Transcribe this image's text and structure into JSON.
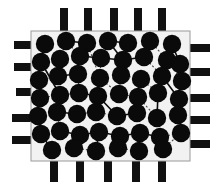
{
  "figure": {
    "title": "Chip floorplan with placed cells and interconnect nets",
    "width": 221,
    "height": 187,
    "background_color": "#ffffff"
  },
  "chart_data": {
    "type": "scatter",
    "title": "Chip floorplan with placed cells and interconnect nets",
    "xlabel": "",
    "ylabel": "",
    "xlim": [
      31,
      190
    ],
    "ylim": [
      31,
      161
    ],
    "grid": false,
    "legend_position": "none",
    "series": [
      {
        "name": "cells",
        "marker": "filled-circle",
        "color": "#0a0a0a",
        "radius": 9.2,
        "points": [
          [
            45,
            44
          ],
          [
            66,
            41
          ],
          [
            87,
            43
          ],
          [
            108,
            41
          ],
          [
            128,
            43
          ],
          [
            150,
            41
          ],
          [
            172,
            44
          ],
          [
            41,
            62
          ],
          [
            60,
            59
          ],
          [
            80,
            56
          ],
          [
            101,
            58
          ],
          [
            123,
            60
          ],
          [
            144,
            57
          ],
          [
            167,
            60
          ],
          [
            180,
            64
          ],
          [
            39,
            80
          ],
          [
            58,
            76
          ],
          [
            78,
            74
          ],
          [
            100,
            78
          ],
          [
            121,
            75
          ],
          [
            141,
            79
          ],
          [
            162,
            76
          ],
          [
            182,
            81
          ],
          [
            40,
            98
          ],
          [
            60,
            95
          ],
          [
            79,
            93
          ],
          [
            98,
            96
          ],
          [
            119,
            94
          ],
          [
            138,
            97
          ],
          [
            158,
            93
          ],
          [
            179,
            99
          ],
          [
            38,
            116
          ],
          [
            57,
            112
          ],
          [
            77,
            114
          ],
          [
            96,
            112
          ],
          [
            117,
            116
          ],
          [
            137,
            113
          ],
          [
            157,
            118
          ],
          [
            178,
            115
          ],
          [
            41,
            134
          ],
          [
            60,
            131
          ],
          [
            80,
            135
          ],
          [
            99,
            132
          ],
          [
            120,
            136
          ],
          [
            140,
            133
          ],
          [
            160,
            137
          ],
          [
            181,
            133
          ],
          [
            52,
            150
          ],
          [
            74,
            148
          ],
          [
            96,
            151
          ],
          [
            118,
            148
          ],
          [
            139,
            151
          ],
          [
            163,
            149
          ]
        ]
      }
    ],
    "nets": [
      {
        "style": "solid",
        "path": [
          [
            45,
            44
          ],
          [
            41,
            62
          ],
          [
            60,
            95
          ]
        ]
      },
      {
        "style": "solid",
        "path": [
          [
            66,
            41
          ],
          [
            87,
            43
          ]
        ]
      },
      {
        "style": "solid",
        "path": [
          [
            108,
            41
          ],
          [
            123,
            60
          ]
        ]
      },
      {
        "style": "solid",
        "path": [
          [
            128,
            43
          ],
          [
            108,
            41
          ]
        ]
      },
      {
        "style": "solid",
        "path": [
          [
            80,
            56
          ],
          [
            101,
            58
          ],
          [
            123,
            60
          ],
          [
            144,
            57
          ]
        ]
      },
      {
        "style": "solid",
        "path": [
          [
            58,
            76
          ],
          [
            78,
            74
          ]
        ]
      },
      {
        "style": "solid",
        "path": [
          [
            79,
            93
          ],
          [
            98,
            96
          ],
          [
            117,
            116
          ]
        ]
      },
      {
        "style": "solid",
        "path": [
          [
            117,
            116
          ],
          [
            137,
            113
          ]
        ]
      },
      {
        "style": "solid",
        "path": [
          [
            57,
            112
          ],
          [
            77,
            114
          ]
        ]
      },
      {
        "style": "solid",
        "path": [
          [
            60,
            131
          ],
          [
            80,
            135
          ],
          [
            99,
            132
          ]
        ]
      },
      {
        "style": "solid",
        "path": [
          [
            99,
            132
          ],
          [
            120,
            136
          ],
          [
            140,
            133
          ]
        ]
      },
      {
        "style": "solid",
        "path": [
          [
            120,
            136
          ],
          [
            118,
            148
          ]
        ]
      },
      {
        "style": "solid",
        "path": [
          [
            140,
            133
          ],
          [
            160,
            137
          ]
        ]
      },
      {
        "style": "solid",
        "path": [
          [
            38,
            116
          ],
          [
            41,
            134
          ],
          [
            52,
            150
          ]
        ]
      },
      {
        "style": "solid",
        "path": [
          [
            162,
            76
          ],
          [
            179,
            99
          ]
        ]
      },
      {
        "style": "solid",
        "path": [
          [
            158,
            93
          ],
          [
            157,
            118
          ]
        ]
      },
      {
        "style": "solid",
        "path": [
          [
            96,
            151
          ],
          [
            99,
            132
          ]
        ]
      },
      {
        "style": "solid",
        "path": [
          [
            172,
            44
          ],
          [
            180,
            64
          ]
        ]
      },
      {
        "style": "dashed",
        "path": [
          [
            66,
            41
          ],
          [
            80,
            56
          ]
        ]
      },
      {
        "style": "dashed",
        "path": [
          [
            87,
            43
          ],
          [
            100,
            78
          ]
        ]
      },
      {
        "style": "dashed",
        "path": [
          [
            101,
            58
          ],
          [
            100,
            78
          ]
        ]
      },
      {
        "style": "dashed",
        "path": [
          [
            121,
            75
          ],
          [
            141,
            79
          ]
        ]
      },
      {
        "style": "dashed",
        "path": [
          [
            144,
            57
          ],
          [
            162,
            76
          ]
        ]
      },
      {
        "style": "dashed",
        "path": [
          [
            150,
            41
          ],
          [
            167,
            60
          ]
        ]
      },
      {
        "style": "dashed",
        "path": [
          [
            39,
            80
          ],
          [
            58,
            76
          ]
        ]
      },
      {
        "style": "dashed",
        "path": [
          [
            40,
            98
          ],
          [
            60,
            95
          ]
        ]
      },
      {
        "style": "dashed",
        "path": [
          [
            60,
            95
          ],
          [
            79,
            93
          ]
        ]
      },
      {
        "style": "dashed",
        "path": [
          [
            78,
            74
          ],
          [
            79,
            93
          ]
        ]
      },
      {
        "style": "dashed",
        "path": [
          [
            100,
            78
          ],
          [
            119,
            94
          ]
        ]
      },
      {
        "style": "dashed",
        "path": [
          [
            119,
            94
          ],
          [
            138,
            97
          ]
        ]
      },
      {
        "style": "dashed",
        "path": [
          [
            138,
            97
          ],
          [
            157,
            118
          ]
        ]
      },
      {
        "style": "dashed",
        "path": [
          [
            96,
            112
          ],
          [
            117,
            116
          ]
        ]
      },
      {
        "style": "dashed",
        "path": [
          [
            77,
            114
          ],
          [
            96,
            112
          ]
        ]
      },
      {
        "style": "dashed",
        "path": [
          [
            57,
            112
          ],
          [
            60,
            131
          ]
        ]
      },
      {
        "style": "dashed",
        "path": [
          [
            160,
            137
          ],
          [
            181,
            133
          ]
        ]
      },
      {
        "style": "dashed",
        "path": [
          [
            163,
            149
          ],
          [
            181,
            133
          ]
        ]
      },
      {
        "style": "dashed",
        "path": [
          [
            74,
            148
          ],
          [
            96,
            151
          ]
        ]
      },
      {
        "style": "dashed",
        "path": [
          [
            118,
            148
          ],
          [
            139,
            151
          ]
        ]
      },
      {
        "style": "dashed",
        "path": [
          [
            141,
            79
          ],
          [
            158,
            93
          ]
        ]
      },
      {
        "style": "dashed",
        "path": [
          [
            121,
            75
          ],
          [
            119,
            94
          ]
        ]
      },
      {
        "style": "dashed",
        "path": [
          [
            167,
            60
          ],
          [
            182,
            81
          ]
        ]
      },
      {
        "style": "dashed",
        "path": [
          [
            98,
            96
          ],
          [
            96,
            112
          ]
        ]
      }
    ]
  },
  "die": {
    "label": "die-boundary",
    "x": 31,
    "y": 31,
    "width": 159,
    "height": 130,
    "fill_color": "#f2f2f2",
    "stroke_color": "#9a9a9a"
  },
  "pins": {
    "color": "#111111",
    "count": 20,
    "top": [
      {
        "x": 60,
        "y": 8,
        "width": 8,
        "height": 24
      },
      {
        "x": 84,
        "y": 8,
        "width": 8,
        "height": 24
      },
      {
        "x": 110,
        "y": 8,
        "width": 8,
        "height": 24
      },
      {
        "x": 134,
        "y": 8,
        "width": 8,
        "height": 24
      },
      {
        "x": 158,
        "y": 8,
        "width": 8,
        "height": 24
      }
    ],
    "bottom": [
      {
        "x": 50,
        "y": 158,
        "width": 8,
        "height": 24
      },
      {
        "x": 76,
        "y": 158,
        "width": 8,
        "height": 24
      },
      {
        "x": 104,
        "y": 158,
        "width": 8,
        "height": 24
      },
      {
        "x": 132,
        "y": 158,
        "width": 8,
        "height": 24
      },
      {
        "x": 158,
        "y": 158,
        "width": 8,
        "height": 24
      }
    ],
    "left": [
      {
        "x": 14,
        "y": 41,
        "width": 24,
        "height": 8
      },
      {
        "x": 14,
        "y": 63,
        "width": 24,
        "height": 8
      },
      {
        "x": 16,
        "y": 88,
        "width": 22,
        "height": 8
      },
      {
        "x": 12,
        "y": 114,
        "width": 26,
        "height": 8
      },
      {
        "x": 12,
        "y": 136,
        "width": 26,
        "height": 8
      }
    ],
    "right": [
      {
        "x": 184,
        "y": 44,
        "width": 26,
        "height": 8
      },
      {
        "x": 184,
        "y": 68,
        "width": 26,
        "height": 8
      },
      {
        "x": 186,
        "y": 94,
        "width": 24,
        "height": 8
      },
      {
        "x": 184,
        "y": 116,
        "width": 26,
        "height": 8
      },
      {
        "x": 184,
        "y": 140,
        "width": 26,
        "height": 8
      }
    ]
  },
  "styles": {
    "node_color": "#0a0a0a",
    "solid_net_color": "#0d0d0d",
    "dashed_net_color": "#4a4a4a",
    "solid_net_width": 1.6,
    "dashed_net_width": 1.1
  }
}
